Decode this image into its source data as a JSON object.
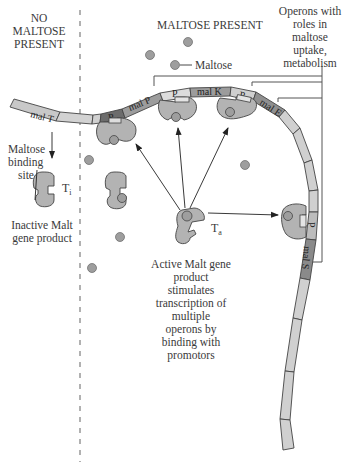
{
  "regions": {
    "left_heading": [
      "NO",
      "MALTOSE",
      "PRESENT"
    ],
    "right_heading": "MALTOSE PRESENT"
  },
  "labels": {
    "maltose": "Maltose",
    "operons": [
      "Operons with",
      "roles in",
      "maltose",
      "uptake,",
      "metabolism"
    ],
    "binding_site": [
      "Maltose",
      "binding",
      "site"
    ],
    "inactive": [
      "Inactive Malt",
      "gene product"
    ],
    "active": [
      "Active Malt gene",
      "product",
      "stimulates",
      "transcription of",
      "multiple",
      "operons by",
      "binding with",
      "promotors"
    ],
    "t_inactive": "T",
    "t_inactive_sub": "i",
    "t_active": "T",
    "t_active_sub": "a"
  },
  "dna_segments": {
    "mal_t": "mal T",
    "p1": "P",
    "mal_p": "mal P",
    "p2": "P",
    "mal_k": "mal K",
    "p3": "P",
    "mal_e": "mal E",
    "p4": "P",
    "mal_s": "mal S"
  },
  "colors": {
    "dna_light": "#d0d0d0",
    "dna_medium": "#9a9a9a",
    "dna_dark": "#6e6e6e",
    "protein": "#b3b3b3",
    "maltose": "#9e9e9e",
    "line": "#333333"
  }
}
